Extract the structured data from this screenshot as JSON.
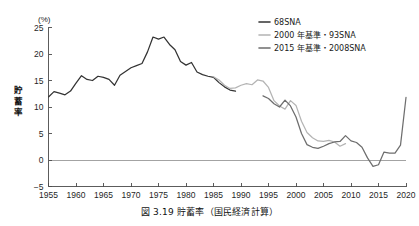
{
  "caption": "図 3.19  貯蓄率（国民経済計算）",
  "chart_data": {
    "type": "line",
    "title": "",
    "subtitle": "",
    "xlabel": "",
    "ylabel": "貯蓄率",
    "yunit": "(%)",
    "xlim": [
      1955,
      2020
    ],
    "ylim": [
      -5,
      25
    ],
    "ytick_labels": [
      "25",
      "20",
      "15",
      "10",
      "5",
      "0",
      "-5"
    ],
    "ytick_values": [
      25,
      20,
      15,
      10,
      5,
      0,
      -5
    ],
    "xtick_labels": [
      "1955",
      "1960",
      "1965",
      "1970",
      "1975",
      "1980",
      "1985",
      "1990",
      "1995",
      "2000",
      "2005",
      "2010",
      "2015",
      "2020"
    ],
    "xtick_values": [
      1955,
      1960,
      1965,
      1970,
      1975,
      1980,
      1985,
      1990,
      1995,
      2000,
      2005,
      2010,
      2015,
      2020
    ],
    "grid": false,
    "legend_position": "top-right",
    "zero_line": true,
    "series": [
      {
        "name": "68SNA",
        "color": "#333333",
        "width": 1.25,
        "x": [
          1955,
          1956,
          1957,
          1958,
          1959,
          1960,
          1961,
          1962,
          1963,
          1964,
          1965,
          1966,
          1967,
          1968,
          1969,
          1970,
          1971,
          1972,
          1973,
          1974,
          1975,
          1976,
          1977,
          1978,
          1979,
          1980,
          1981,
          1982,
          1983,
          1984,
          1985,
          1986,
          1987,
          1988,
          1989
        ],
        "values": [
          11.9,
          12.9,
          12.6,
          12.3,
          13.0,
          14.5,
          15.9,
          15.2,
          15.0,
          15.8,
          15.6,
          15.2,
          14.1,
          16.0,
          16.7,
          17.4,
          17.8,
          18.2,
          20.4,
          23.2,
          22.8,
          23.2,
          21.8,
          20.8,
          18.6,
          17.9,
          18.4,
          16.6,
          16.1,
          15.8,
          15.6,
          14.6,
          13.8,
          13.2,
          13.0
        ]
      },
      {
        "name": "2000 年基準・93SNA",
        "color": "#b4b4b4",
        "width": 1.25,
        "x": [
          1985,
          1986,
          1987,
          1988,
          1989,
          1990,
          1991,
          1992,
          1993,
          1994,
          1995,
          1996,
          1997,
          1998,
          1999,
          2000,
          2001,
          2002,
          2003,
          2004,
          2005,
          2006,
          2007,
          2008,
          2009
        ],
        "values": [
          15.7,
          15.1,
          14.1,
          13.5,
          13.6,
          14.1,
          14.4,
          14.2,
          15.1,
          14.9,
          13.7,
          11.2,
          10.2,
          9.6,
          11.2,
          10.3,
          7.3,
          5.2,
          4.2,
          3.6,
          3.5,
          3.7,
          3.4,
          2.6,
          3.1
        ]
      },
      {
        "name": "2015 年基準・2008SNA",
        "color": "#6e6e6e",
        "width": 1.25,
        "x": [
          1994,
          1995,
          1996,
          1997,
          1998,
          1999,
          2000,
          2001,
          2002,
          2003,
          2004,
          2005,
          2006,
          2007,
          2008,
          2009,
          2010,
          2011,
          2012,
          2013,
          2014,
          2015,
          2016,
          2017,
          2018,
          2019,
          2020
        ],
        "values": [
          12.1,
          11.6,
          10.6,
          10.0,
          11.3,
          10.2,
          8.1,
          5.0,
          2.9,
          2.4,
          2.2,
          2.6,
          3.1,
          3.4,
          3.5,
          4.6,
          3.6,
          3.3,
          2.4,
          0.4,
          -1.2,
          -0.9,
          1.5,
          1.3,
          1.3,
          2.8,
          11.8
        ]
      }
    ],
    "legend": [
      {
        "label": "68SNA",
        "color": "#333333"
      },
      {
        "label": "2000 年基準・93SNA",
        "color": "#b4b4b4"
      },
      {
        "label": "2015 年基準・2008SNA",
        "color": "#6e6e6e"
      }
    ]
  }
}
